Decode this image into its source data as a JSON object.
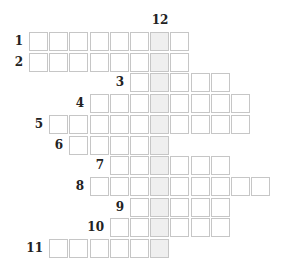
{
  "puzzle": {
    "type": "crossword",
    "key_column": 6,
    "key_number": "12",
    "colors": {
      "border": "#c6c6c6",
      "cell": "#ffffff",
      "key_cell": "#efefef",
      "number": "#222222"
    },
    "rows": [
      {
        "number": "1",
        "start_col": 0,
        "length": 8
      },
      {
        "number": "2",
        "start_col": 0,
        "length": 8
      },
      {
        "number": "3",
        "start_col": 5,
        "length": 5
      },
      {
        "number": "4",
        "start_col": 3,
        "length": 8
      },
      {
        "number": "5",
        "start_col": 1,
        "length": 10
      },
      {
        "number": "6",
        "start_col": 2,
        "length": 5
      },
      {
        "number": "7",
        "start_col": 4,
        "length": 6
      },
      {
        "number": "8",
        "start_col": 3,
        "length": 9
      },
      {
        "number": "9",
        "start_col": 5,
        "length": 5
      },
      {
        "number": "10",
        "start_col": 4,
        "length": 6
      },
      {
        "number": "11",
        "start_col": 1,
        "length": 6
      }
    ]
  }
}
